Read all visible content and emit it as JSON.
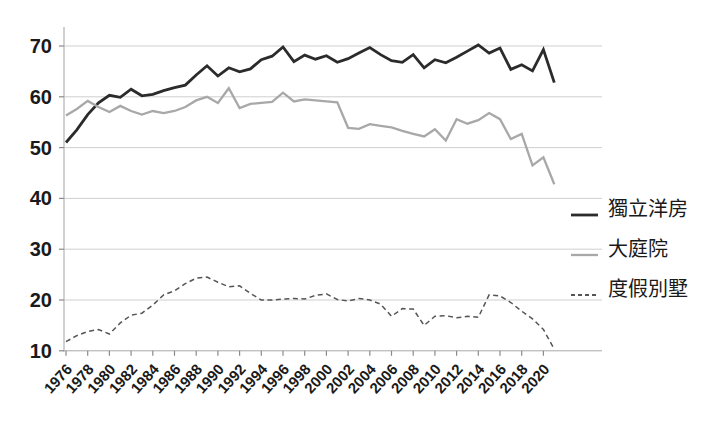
{
  "chart_data": {
    "type": "line",
    "x": [
      1976,
      1977,
      1978,
      1979,
      1980,
      1981,
      1982,
      1983,
      1984,
      1985,
      1986,
      1987,
      1988,
      1989,
      1990,
      1991,
      1992,
      1993,
      1994,
      1995,
      1996,
      1997,
      1998,
      1999,
      2000,
      2001,
      2002,
      2003,
      2004,
      2005,
      2006,
      2007,
      2008,
      2009,
      2010,
      2011,
      2012,
      2013,
      2014,
      2015,
      2016,
      2017,
      2018,
      2019,
      2020,
      2021
    ],
    "xtick_labels": [
      "1976",
      "1978",
      "1980",
      "1982",
      "1984",
      "1986",
      "1988",
      "1990",
      "1992",
      "1994",
      "1996",
      "1998",
      "2000",
      "2002",
      "2004",
      "2006",
      "2008",
      "2010",
      "2012",
      "2014",
      "2016",
      "2018",
      "2020"
    ],
    "yticks": [
      10,
      20,
      30,
      40,
      50,
      60,
      70
    ],
    "ylim": [
      10,
      70
    ],
    "xlim": [
      1976,
      2021
    ],
    "grid": "horizontal",
    "legend_position": "right-middle",
    "axis_color": "#b3b3b3",
    "gridline_color": "#cfcfcf",
    "bottom_gridline_color": "#a8a8a8",
    "tick_mark_color": "#8a8a8a",
    "tick_label_color": "#1a1a1a",
    "series": [
      {
        "name": "獨立洋房",
        "line_style": "solid",
        "color": "#2b2b2b",
        "stroke_width": 2.8,
        "values": [
          51.0,
          53.5,
          56.5,
          58.8,
          60.3,
          59.9,
          61.5,
          60.2,
          60.5,
          61.2,
          61.8,
          62.3,
          64.3,
          66.1,
          64.1,
          65.7,
          64.9,
          65.5,
          67.3,
          68.0,
          69.8,
          66.9,
          68.2,
          67.4,
          68.1,
          66.8,
          67.5,
          68.6,
          69.7,
          68.3,
          67.1,
          66.8,
          68.3,
          65.7,
          67.3,
          66.7,
          67.8,
          69.0,
          70.2,
          68.6,
          69.6,
          65.4,
          66.3,
          65.1,
          69.3,
          62.8
        ]
      },
      {
        "name": "大庭院",
        "line_style": "solid",
        "color": "#a8a8a8",
        "stroke_width": 2.3,
        "values": [
          56.3,
          57.6,
          59.2,
          58.0,
          57.0,
          58.2,
          57.2,
          56.5,
          57.2,
          56.8,
          57.2,
          58.0,
          59.3,
          60.0,
          58.8,
          61.7,
          57.8,
          58.6,
          58.8,
          59.0,
          60.8,
          59.1,
          59.5,
          59.3,
          59.1,
          58.9,
          53.9,
          53.7,
          54.6,
          54.3,
          54.0,
          53.3,
          52.7,
          52.2,
          53.6,
          51.4,
          55.6,
          54.7,
          55.4,
          56.8,
          55.6,
          51.7,
          52.7,
          46.5,
          48.1,
          42.8
        ]
      },
      {
        "name": "度假別墅",
        "line_style": "dashed",
        "color": "#555555",
        "stroke_width": 1.5,
        "dash_pattern": "5 3.5",
        "values": [
          11.8,
          13.0,
          13.8,
          14.2,
          13.3,
          15.5,
          17.0,
          17.4,
          19.0,
          21.0,
          21.8,
          23.2,
          24.3,
          24.5,
          23.5,
          22.6,
          22.8,
          21.3,
          20.0,
          20.0,
          20.2,
          20.3,
          20.2,
          20.9,
          21.2,
          20.1,
          19.8,
          20.3,
          20.0,
          19.2,
          16.8,
          18.3,
          18.2,
          15.0,
          16.8,
          16.9,
          16.5,
          16.8,
          16.6,
          21.0,
          20.8,
          19.5,
          17.8,
          16.3,
          14.2,
          10.3
        ]
      }
    ]
  }
}
